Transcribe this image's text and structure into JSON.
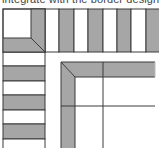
{
  "caption": "integrate with the border design",
  "colors": {
    "band": "#a6a6a6",
    "line": "#3a3a3a",
    "background": "#ffffff"
  },
  "diagram": {
    "outer_corner": {
      "x": 3,
      "y": 9,
      "size": 42
    },
    "top_row_stripes": [
      {
        "x": 31,
        "w": 14,
        "fill": "band"
      },
      {
        "x": 45,
        "w": 14,
        "fill": "white"
      },
      {
        "x": 59,
        "w": 15,
        "fill": "band"
      },
      {
        "x": 74,
        "w": 14,
        "fill": "white"
      },
      {
        "x": 88,
        "w": 15,
        "fill": "band"
      },
      {
        "x": 103,
        "w": 14,
        "fill": "white"
      },
      {
        "x": 117,
        "w": 14,
        "fill": "band"
      },
      {
        "x": 131,
        "w": 15,
        "fill": "white"
      },
      {
        "x": 146,
        "w": 13,
        "fill": "band"
      }
    ],
    "left_column_stripes": [
      {
        "y": 38,
        "h": 14,
        "fill": "band"
      },
      {
        "y": 52,
        "h": 14,
        "fill": "white"
      },
      {
        "y": 66,
        "h": 15,
        "fill": "band"
      },
      {
        "y": 81,
        "h": 14,
        "fill": "white"
      },
      {
        "y": 95,
        "h": 15,
        "fill": "band"
      },
      {
        "y": 110,
        "h": 14,
        "fill": "white"
      },
      {
        "y": 124,
        "h": 15,
        "fill": "band"
      },
      {
        "y": 139,
        "h": 9,
        "fill": "white"
      }
    ],
    "inner_corner": {
      "x": 61,
      "y": 62,
      "band_width": 14
    }
  }
}
